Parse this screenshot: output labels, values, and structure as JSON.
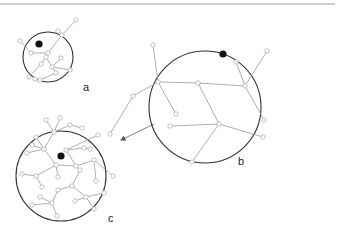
{
  "figure": {
    "top_rule": {
      "x1": 0,
      "x2": 335,
      "y": 4,
      "color": "#9a9a9a"
    },
    "arrow": {
      "from": [
        154,
        124
      ],
      "to": [
        121,
        140
      ],
      "color": "#777777"
    },
    "panels": [
      {
        "id": "a",
        "label": "a",
        "label_pos": [
          83,
          91
        ],
        "circle": {
          "cx": 48,
          "cy": 57,
          "r": 25
        },
        "root": [
          39,
          44
        ],
        "nodes": [
          [
            48,
            53
          ],
          [
            62,
            35
          ],
          [
            76,
            20
          ],
          [
            58,
            31
          ],
          [
            31,
            53
          ],
          [
            20,
            41
          ],
          [
            46,
            57
          ],
          [
            52,
            67
          ],
          [
            41,
            64
          ],
          [
            29,
            77
          ],
          [
            61,
            58
          ],
          [
            70,
            70
          ],
          [
            56,
            73
          ],
          [
            40,
            80
          ],
          [
            35,
            79
          ]
        ],
        "edges": [
          [
            0,
            1
          ],
          [
            1,
            2
          ],
          [
            1,
            3
          ],
          [
            0,
            4
          ],
          [
            4,
            5
          ],
          [
            0,
            6
          ],
          [
            6,
            7
          ],
          [
            6,
            8
          ],
          [
            8,
            9
          ],
          [
            7,
            10
          ],
          [
            7,
            11
          ],
          [
            7,
            12
          ],
          [
            12,
            13
          ]
        ]
      },
      {
        "id": "b",
        "label": "b",
        "label_pos": [
          238,
          165
        ],
        "circle": {
          "cx": 205,
          "cy": 107,
          "r": 56
        },
        "root": [
          223,
          54
        ],
        "nodes": [
          [
            198,
            83
          ],
          [
            158,
            82
          ],
          [
            153,
            45
          ],
          [
            133,
            96
          ],
          [
            176,
            114
          ],
          [
            245,
            86
          ],
          [
            236,
            62
          ],
          [
            267,
            51
          ],
          [
            264,
            120
          ],
          [
            219,
            124
          ],
          [
            170,
            126
          ],
          [
            263,
            137
          ],
          [
            192,
            162
          ],
          [
            110,
            134
          ]
        ],
        "edges": [
          [
            0,
            1
          ],
          [
            1,
            2
          ],
          [
            1,
            3
          ],
          [
            1,
            4
          ],
          [
            0,
            5
          ],
          [
            5,
            6
          ],
          [
            5,
            7
          ],
          [
            5,
            8
          ],
          [
            0,
            9
          ],
          [
            9,
            10
          ],
          [
            9,
            11
          ],
          [
            9,
            12
          ],
          [
            3,
            13
          ]
        ]
      },
      {
        "id": "c",
        "label": "c",
        "label_pos": [
          108,
          222
        ],
        "circle": {
          "cx": 61,
          "cy": 176,
          "r": 45
        },
        "root": [
          61,
          156
        ],
        "nodes": [
          [
            76,
            166
          ],
          [
            56,
            165
          ],
          [
            44,
            149
          ],
          [
            32,
            145
          ],
          [
            36,
            137
          ],
          [
            54,
            132
          ],
          [
            70,
            125
          ],
          [
            82,
            128
          ],
          [
            60,
            118
          ],
          [
            46,
            120
          ],
          [
            94,
            160
          ],
          [
            113,
            176
          ],
          [
            96,
            181
          ],
          [
            80,
            170
          ],
          [
            72,
            186
          ],
          [
            58,
            190
          ],
          [
            52,
            203
          ],
          [
            40,
            197
          ],
          [
            32,
            205
          ],
          [
            57,
            216
          ],
          [
            86,
            197
          ],
          [
            104,
            193
          ],
          [
            94,
            209
          ],
          [
            75,
            201
          ],
          [
            36,
            176
          ],
          [
            22,
            174
          ],
          [
            42,
            187
          ],
          [
            58,
            177
          ],
          [
            66,
            150
          ],
          [
            98,
            135
          ],
          [
            84,
            148
          ],
          [
            90,
            149
          ],
          [
            27,
            153
          ]
        ],
        "edges": [
          [
            0,
            1
          ],
          [
            1,
            2
          ],
          [
            2,
            3
          ],
          [
            2,
            4
          ],
          [
            2,
            5
          ],
          [
            5,
            6
          ],
          [
            6,
            7
          ],
          [
            5,
            8
          ],
          [
            5,
            9
          ],
          [
            0,
            10
          ],
          [
            10,
            11
          ],
          [
            10,
            12
          ],
          [
            0,
            13
          ],
          [
            13,
            14
          ],
          [
            14,
            15
          ],
          [
            15,
            16
          ],
          [
            16,
            17
          ],
          [
            16,
            18
          ],
          [
            16,
            19
          ],
          [
            14,
            20
          ],
          [
            20,
            21
          ],
          [
            20,
            22
          ],
          [
            20,
            23
          ],
          [
            1,
            24
          ],
          [
            24,
            25
          ],
          [
            24,
            26
          ],
          [
            1,
            27
          ],
          [
            0,
            28
          ],
          [
            28,
            29
          ],
          [
            28,
            30
          ],
          [
            30,
            31
          ],
          [
            2,
            32
          ]
        ]
      }
    ]
  }
}
